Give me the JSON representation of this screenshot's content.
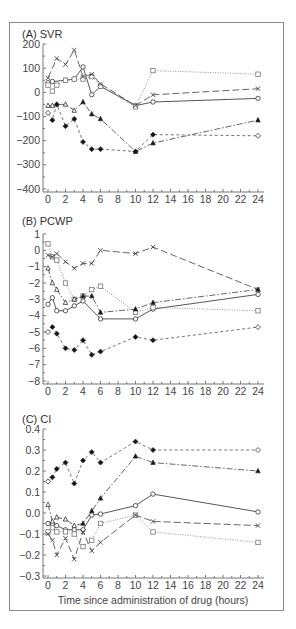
{
  "chart_data": [
    {
      "type": "line",
      "title": "(A) SVR",
      "xlabel": "",
      "ylabel": "",
      "ylim": [
        -400,
        200
      ],
      "xlim": [
        0,
        24
      ],
      "yticks": [
        200,
        100,
        0,
        -100,
        -200,
        -300,
        -400
      ],
      "ytick_labels": [
        "200",
        "100",
        "0",
        "−100",
        "−200",
        "−300",
        "−400"
      ],
      "xticks": [
        0,
        2,
        4,
        6,
        8,
        10,
        12,
        14,
        16,
        18,
        20,
        22,
        24
      ],
      "xtick_labels": [
        "0",
        "2",
        "4",
        "6",
        "8",
        "10",
        "12",
        "14",
        "16",
        "18",
        "20",
        "22",
        "24"
      ],
      "grid": false,
      "series": [
        {
          "name": "circle-solid",
          "style": "solid",
          "marker": "circle",
          "x": [
            0,
            0.5,
            2,
            3,
            4,
            5,
            6,
            10,
            12,
            24
          ],
          "values": [
            40,
            45,
            50,
            55,
            105,
            -10,
            25,
            -55,
            -40,
            -25
          ]
        },
        {
          "name": "square-dotted",
          "style": "dotted",
          "marker": "square",
          "x": [
            0,
            0.5,
            1,
            2,
            3,
            4,
            5,
            6,
            10,
            12,
            24
          ],
          "values": [
            30,
            5,
            30,
            50,
            55,
            55,
            65,
            25,
            -60,
            90,
            75
          ]
        },
        {
          "name": "cross-longdash",
          "style": "longdash",
          "marker": "cross",
          "x": [
            0,
            1,
            2,
            3,
            4,
            5,
            6,
            10,
            12,
            24
          ],
          "values": [
            60,
            140,
            115,
            175,
            65,
            75,
            35,
            -55,
            -10,
            15
          ]
        },
        {
          "name": "triangle-dashdot",
          "style": "dashdot",
          "marker": "triangle",
          "x": [
            0,
            0.5,
            1,
            2,
            3,
            4,
            5,
            6,
            10,
            12,
            24
          ],
          "values": [
            -55,
            -55,
            -50,
            -50,
            -75,
            -40,
            -90,
            -110,
            -245,
            -210,
            -115
          ]
        },
        {
          "name": "diamond-shortdash",
          "style": "shortdash",
          "marker": "diamond",
          "x": [
            0,
            0.5,
            1,
            2,
            3,
            4,
            5,
            6,
            10,
            12,
            24
          ],
          "values": [
            -85,
            -115,
            -50,
            -140,
            -110,
            -205,
            -235,
            -235,
            -245,
            -175,
            -180
          ]
        }
      ]
    },
    {
      "type": "line",
      "title": "(B) PCWP",
      "xlabel": "",
      "ylabel": "",
      "ylim": [
        -8,
        1
      ],
      "xlim": [
        0,
        24
      ],
      "yticks": [
        1,
        0,
        -1,
        -2,
        -3,
        -4,
        -5,
        -6,
        -7,
        -8
      ],
      "ytick_labels": [
        "1",
        "0",
        "−1",
        "−2",
        "−3",
        "−4",
        "−5",
        "−6",
        "−7",
        "−8"
      ],
      "xticks": [
        0,
        2,
        4,
        6,
        8,
        10,
        12,
        14,
        16,
        18,
        20,
        22,
        24
      ],
      "xtick_labels": [
        "0",
        "2",
        "4",
        "6",
        "8",
        "10",
        "12",
        "14",
        "16",
        "18",
        "20",
        "22",
        "24"
      ],
      "grid": false,
      "series": [
        {
          "name": "circle-solid",
          "style": "solid",
          "marker": "circle",
          "x": [
            0,
            0.5,
            1,
            2,
            3,
            4,
            6,
            10,
            12,
            24
          ],
          "values": [
            -3.3,
            -2.9,
            -3.7,
            -3.7,
            -3.4,
            -3.1,
            -4.2,
            -4.2,
            -3.6,
            -2.7
          ]
        },
        {
          "name": "square-dotted",
          "style": "dotted",
          "marker": "square",
          "x": [
            0,
            0.5,
            1,
            2,
            3,
            4,
            5,
            6,
            10,
            12,
            24
          ],
          "values": [
            0.4,
            -0.4,
            -0.6,
            -2.0,
            -3.0,
            -2.8,
            -2.4,
            -2.2,
            -3.8,
            -3.5,
            -3.7
          ]
        },
        {
          "name": "cross-longdash",
          "style": "longdash",
          "marker": "cross",
          "x": [
            0,
            0.5,
            1,
            2,
            3,
            4,
            5,
            6,
            10,
            12,
            24
          ],
          "values": [
            -0.3,
            -0.4,
            -0.2,
            -0.7,
            -1.1,
            -0.8,
            -0.8,
            0.0,
            -0.2,
            0.2,
            -2.4
          ]
        },
        {
          "name": "triangle-dashdot",
          "style": "dashdot",
          "marker": "triangle",
          "x": [
            0,
            0.5,
            1,
            2,
            3,
            4,
            5,
            6,
            10,
            12,
            24
          ],
          "values": [
            -1.1,
            -2.0,
            -2.4,
            -3.2,
            -3.0,
            -2.8,
            -2.8,
            -3.8,
            -3.6,
            -3.2,
            -2.4
          ]
        },
        {
          "name": "diamond-shortdash",
          "style": "shortdash",
          "marker": "diamond",
          "x": [
            0,
            0.5,
            1,
            2,
            3,
            4,
            5,
            6,
            10,
            12,
            24
          ],
          "values": [
            -5.0,
            -4.7,
            -5.1,
            -6.0,
            -6.1,
            -5.5,
            -6.4,
            -6.2,
            -5.3,
            -5.5,
            -4.7
          ]
        }
      ]
    },
    {
      "type": "line",
      "title": "(C) CI",
      "xlabel": "Time since administration of drug (hours)",
      "ylabel": "",
      "ylim": [
        -0.3,
        0.4
      ],
      "xlim": [
        0,
        24
      ],
      "yticks": [
        0.4,
        0.3,
        0.2,
        0.1,
        0.0,
        -0.1,
        -0.2,
        -0.3
      ],
      "ytick_labels": [
        "0.4",
        "0.3",
        "0.2",
        "0.1",
        "0.0",
        "−0.1",
        "−0.2",
        "−0.3"
      ],
      "xticks": [
        0,
        2,
        4,
        6,
        8,
        10,
        12,
        14,
        16,
        18,
        20,
        22,
        24
      ],
      "xtick_labels": [
        "0",
        "2",
        "4",
        "6",
        "8",
        "10",
        "12",
        "14",
        "16",
        "18",
        "20",
        "22",
        "24"
      ],
      "grid": false,
      "series": [
        {
          "name": "circle-solid",
          "style": "solid",
          "marker": "circle",
          "x": [
            0,
            0.5,
            1,
            2,
            3,
            4,
            5,
            6,
            10,
            12,
            24
          ],
          "values": [
            -0.05,
            -0.05,
            -0.06,
            -0.08,
            -0.08,
            -0.08,
            -0.01,
            -0.005,
            0.035,
            0.09,
            0.005
          ]
        },
        {
          "name": "square-dotted",
          "style": "dotted",
          "marker": "square",
          "x": [
            0,
            0.5,
            1,
            2,
            3,
            4,
            5,
            6,
            10,
            12,
            24
          ],
          "values": [
            -0.09,
            -0.07,
            -0.09,
            -0.09,
            -0.1,
            -0.16,
            -0.13,
            -0.05,
            -0.01,
            -0.09,
            -0.14
          ]
        },
        {
          "name": "cross-longdash",
          "style": "longdash",
          "marker": "cross",
          "x": [
            0,
            0.5,
            1,
            2,
            3,
            4,
            5,
            6,
            10,
            12,
            24
          ],
          "values": [
            -0.1,
            -0.13,
            -0.2,
            -0.12,
            -0.22,
            -0.09,
            -0.18,
            -0.14,
            -0.01,
            -0.04,
            -0.06
          ]
        },
        {
          "name": "triangle-dashdot",
          "style": "dashdot",
          "marker": "triangle",
          "x": [
            0,
            0.5,
            1,
            2,
            3,
            4,
            5,
            6,
            10,
            12,
            24
          ],
          "values": [
            0.04,
            -0.04,
            -0.02,
            -0.03,
            -0.06,
            -0.05,
            0.01,
            0.07,
            0.27,
            0.24,
            0.2
          ]
        },
        {
          "name": "diamond-shortdash",
          "style": "shortdash",
          "marker": "diamond",
          "x": [
            0,
            0.5,
            1,
            2,
            3,
            4,
            5,
            6,
            10,
            12,
            24
          ],
          "values": [
            0.15,
            0.17,
            0.21,
            0.24,
            0.14,
            0.25,
            0.29,
            0.24,
            0.34,
            0.3,
            0.3
          ]
        }
      ]
    }
  ]
}
